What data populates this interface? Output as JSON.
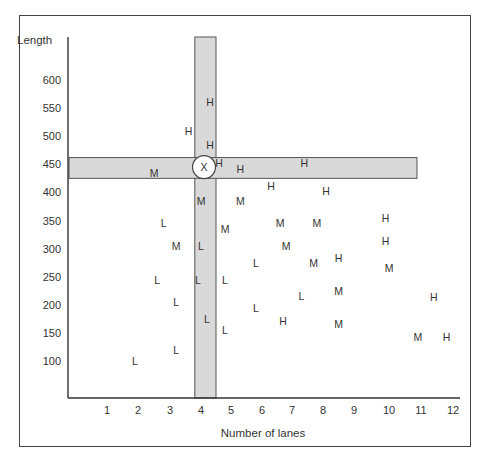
{
  "chart_data": {
    "type": "scatter",
    "title": "",
    "xlabel": "Number of lanes",
    "ylabel": "Length",
    "xlim": [
      0,
      12.5
    ],
    "ylim": [
      30,
      640
    ],
    "x_ticks": [
      1,
      2,
      3,
      4,
      5,
      6,
      7,
      8,
      9,
      10,
      11,
      12
    ],
    "y_ticks": [
      100,
      150,
      200,
      250,
      300,
      350,
      400,
      450,
      500,
      550,
      600
    ],
    "grid": false,
    "legend": null,
    "annotations": [
      {
        "type": "vertical-band",
        "x_range": [
          3.8,
          4.5
        ],
        "label": ""
      },
      {
        "type": "horizontal-band",
        "y_range": [
          425,
          462
        ],
        "label": ""
      },
      {
        "type": "circle-marker",
        "label": "X",
        "x": 4.1,
        "y": 445
      }
    ],
    "series": [
      {
        "name": "H",
        "points": [
          [
            4.3,
            560
          ],
          [
            3.6,
            510
          ],
          [
            4.3,
            485
          ],
          [
            4.6,
            452
          ],
          [
            5.3,
            442
          ],
          [
            7.4,
            452
          ],
          [
            6.3,
            412
          ],
          [
            8.1,
            402
          ],
          [
            9.9,
            355
          ],
          [
            9.9,
            313
          ],
          [
            8.5,
            283
          ],
          [
            11.4,
            213
          ],
          [
            6.7,
            172
          ],
          [
            11.8,
            143
          ]
        ]
      },
      {
        "name": "M",
        "points": [
          [
            2.5,
            435
          ],
          [
            4.0,
            385
          ],
          [
            5.3,
            385
          ],
          [
            4.8,
            335
          ],
          [
            6.6,
            345
          ],
          [
            7.8,
            345
          ],
          [
            3.2,
            305
          ],
          [
            6.8,
            305
          ],
          [
            7.7,
            275
          ],
          [
            10.0,
            265
          ],
          [
            8.5,
            225
          ],
          [
            8.5,
            166
          ],
          [
            10.9,
            143
          ]
        ]
      },
      {
        "name": "L",
        "points": [
          [
            2.8,
            345
          ],
          [
            4.0,
            305
          ],
          [
            2.6,
            245
          ],
          [
            3.9,
            245
          ],
          [
            4.8,
            245
          ],
          [
            5.8,
            275
          ],
          [
            3.2,
            205
          ],
          [
            7.3,
            215
          ],
          [
            4.2,
            175
          ],
          [
            5.8,
            195
          ],
          [
            4.8,
            155
          ],
          [
            3.2,
            120
          ],
          [
            1.9,
            100
          ]
        ]
      }
    ]
  },
  "labels": {
    "x_axis_title": "Number of lanes",
    "y_axis_title": "Length",
    "circle_label": "X"
  }
}
